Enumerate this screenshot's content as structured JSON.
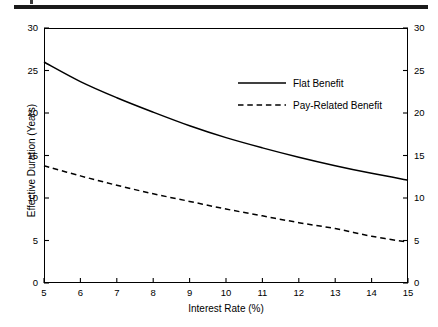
{
  "chart_data": {
    "type": "line",
    "title": "",
    "xlabel": "Interest Rate (%)",
    "ylabel": "Effective Duration (Years)",
    "xlim": [
      5,
      15
    ],
    "ylim": [
      0,
      30
    ],
    "xticks": [
      5,
      6,
      7,
      8,
      9,
      10,
      11,
      12,
      13,
      14,
      15
    ],
    "yticks": [
      0,
      5,
      10,
      15,
      20,
      25,
      30
    ],
    "yticks_right": [
      0,
      5,
      10,
      15,
      20,
      25,
      30
    ],
    "grid": false,
    "legend_position": "upper-right-inside",
    "x": [
      5,
      6,
      7,
      8,
      9,
      10,
      11,
      12,
      13,
      14,
      15
    ],
    "series": [
      {
        "name": "Flat Benefit",
        "style": "solid",
        "color": "#000000",
        "values": [
          26.0,
          23.7,
          21.8,
          20.1,
          18.5,
          17.1,
          15.9,
          14.8,
          13.8,
          12.9,
          12.1
        ]
      },
      {
        "name": "Pay-Related Benefit",
        "style": "dashed",
        "color": "#000000",
        "values": [
          13.8,
          12.6,
          11.5,
          10.5,
          9.6,
          8.7,
          7.9,
          7.1,
          6.4,
          5.5,
          4.8
        ]
      }
    ]
  },
  "axes": {
    "ylabel": "Effective Duration (Years)",
    "xlabel": "Interest Rate (%)",
    "ytick_labels_left": [
      "0",
      "5",
      "10",
      "15",
      "20",
      "25",
      "30"
    ],
    "ytick_labels_right": [
      "0",
      "5",
      "10",
      "15",
      "20",
      "25",
      "30"
    ],
    "xtick_labels": [
      "5",
      "6",
      "7",
      "8",
      "9",
      "10",
      "11",
      "12",
      "13",
      "14",
      "15"
    ]
  },
  "legend": {
    "items": [
      {
        "label": "Flat Benefit",
        "style": "solid"
      },
      {
        "label": "Pay-Related Benefit",
        "style": "dashed"
      }
    ]
  }
}
